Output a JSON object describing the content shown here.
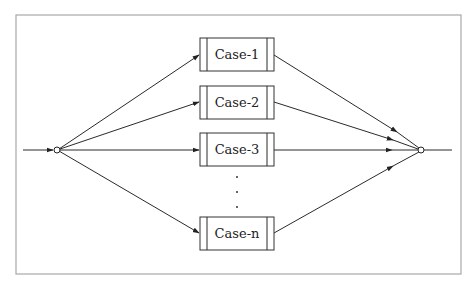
{
  "diagram": {
    "type": "parallel-branch flow diagram",
    "input_node": {
      "shape": "hollow-circle"
    },
    "output_node": {
      "shape": "hollow-circle"
    },
    "cases": [
      {
        "label": "Case-1"
      },
      {
        "label": "Case-2"
      },
      {
        "label": "Case-3"
      },
      {
        "label": "Case-n"
      }
    ],
    "ellipsis": "vertical dots between Case-3 and Case-n",
    "colors": {
      "frame": "#a8a8a8",
      "stroke": "#2a2a2a",
      "background": "#ffffff"
    }
  }
}
